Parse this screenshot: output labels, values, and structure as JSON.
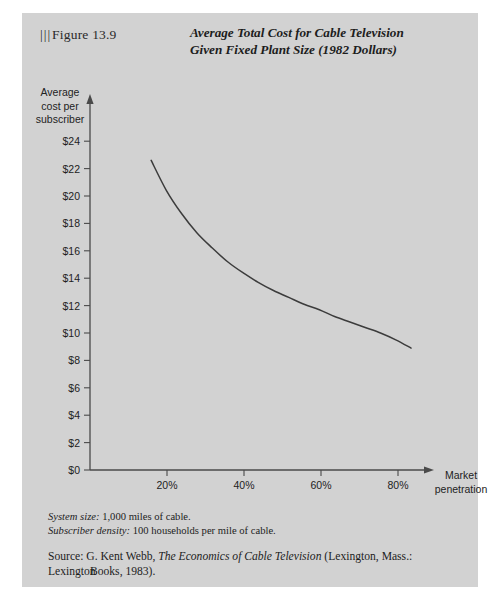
{
  "figure": {
    "bar_marks": "|||",
    "label": "Figure 13.9",
    "title_line1": "Average Total Cost for Cable Television",
    "title_line2": "Given Fixed Plant Size (1982 Dollars)"
  },
  "notes": {
    "system_size_label": "System size:",
    "system_size_value": "1,000 miles of cable.",
    "subscriber_density_label": "Subscriber density:",
    "subscriber_density_value": "100 households per mile of cable.",
    "source_lead": "Source:",
    "source_author": "G. Kent Webb,",
    "source_title": "The Economics of Cable Television",
    "source_pub_line1": "(Lexington, Mass.: Lexington",
    "source_pub_line2": "Books, 1983)."
  },
  "chart_data": {
    "type": "line",
    "title": "Average Total Cost for Cable Television Given Fixed Plant Size (1982 Dollars)",
    "xlabel": "Market penetration",
    "ylabel": "Average cost per subscriber",
    "xlim": [
      0,
      90
    ],
    "ylim": [
      0,
      24
    ],
    "grid": false,
    "legend": null,
    "x_tick_labels": [
      "20%",
      "40%",
      "60%",
      "80%"
    ],
    "x_tick_values": [
      20,
      40,
      60,
      80
    ],
    "y_tick_labels": [
      "$0",
      "$2",
      "$4",
      "$6",
      "$8",
      "$10",
      "$12",
      "$14",
      "$16",
      "$18",
      "$20",
      "$22",
      "$24"
    ],
    "y_tick_values": [
      0,
      2,
      4,
      6,
      8,
      10,
      12,
      14,
      16,
      18,
      20,
      22,
      24
    ],
    "series": [
      {
        "name": "Average total cost",
        "x": [
          16,
          20,
          24,
          28,
          32,
          36,
          40,
          44,
          48,
          52,
          56,
          60,
          64,
          68,
          72,
          76,
          80,
          84
        ],
        "values": [
          22.6,
          20.4,
          18.7,
          17.3,
          16.2,
          15.2,
          14.4,
          13.7,
          13.1,
          12.6,
          12.1,
          11.7,
          11.2,
          10.8,
          10.4,
          10.0,
          9.5,
          8.9
        ]
      }
    ],
    "colors": {
      "line": "#3c3c3c",
      "axis": "#4a4a4a",
      "background": "#d2d2d2"
    }
  }
}
